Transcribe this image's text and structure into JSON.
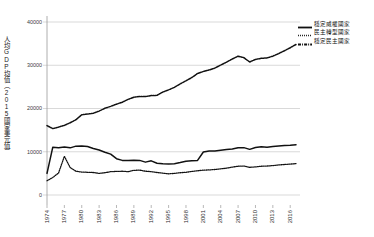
{
  "chart_data": {
    "type": "line",
    "title": "",
    "xlabel": "",
    "ylabel": "人均GDP均值（2015國家美元值）",
    "ylim": [
      0,
      40000
    ],
    "xlim": [
      1974,
      2017
    ],
    "yticks": [
      "0",
      "10000",
      "20000",
      "30000",
      "40000"
    ],
    "ytick_values": [
      0,
      10000,
      20000,
      30000,
      40000
    ],
    "grid": true,
    "legend_position": "top-right",
    "xticks": [
      "1974",
      "1977",
      "1980",
      "1983",
      "1986",
      "1989",
      "1992",
      "1995",
      "1998",
      "2001",
      "2004",
      "2007",
      "2010",
      "2013",
      "2016"
    ],
    "x": [
      1974,
      1975,
      1976,
      1977,
      1978,
      1979,
      1980,
      1981,
      1982,
      1983,
      1984,
      1985,
      1986,
      1987,
      1988,
      1989,
      1990,
      1991,
      1992,
      1993,
      1994,
      1995,
      1996,
      1997,
      1998,
      1999,
      2000,
      2001,
      2002,
      2003,
      2004,
      2005,
      2006,
      2007,
      2008,
      2009,
      2010,
      2011,
      2012,
      2013,
      2014,
      2015,
      2016,
      2017
    ],
    "series": [
      {
        "name": "穩定威權國家",
        "style": "solid",
        "color": "#111111",
        "values": [
          5000,
          11050,
          10950,
          11100,
          10900,
          11300,
          11350,
          11200,
          10750,
          10400,
          9900,
          9450,
          8400,
          8000,
          7950,
          8050,
          8000,
          7600,
          7900,
          7350,
          7200,
          7150,
          7250,
          7500,
          7800,
          7900,
          8000,
          9950,
          10150,
          10200,
          10350,
          10500,
          10650,
          10900,
          10950,
          10550,
          11000,
          11150,
          11050,
          11200,
          11350,
          11450,
          11500,
          11600
        ]
      },
      {
        "name": "民主轉型國家",
        "style": "dotted",
        "color": "#111111",
        "values": [
          3300,
          4050,
          5100,
          8950,
          6350,
          5500,
          5300,
          5250,
          5200,
          5000,
          5150,
          5400,
          5450,
          5500,
          5400,
          5700,
          5750,
          5500,
          5400,
          5200,
          5050,
          4900,
          5000,
          5150,
          5250,
          5450,
          5600,
          5750,
          5800,
          5900,
          6050,
          6200,
          6450,
          6650,
          6700,
          6400,
          6500,
          6650,
          6700,
          6800,
          6950,
          7050,
          7150,
          7250
        ]
      },
      {
        "name": "穩定民主國家",
        "style": "dashdot",
        "color": "#111111",
        "values": [
          16050,
          15350,
          15700,
          16100,
          16700,
          17400,
          18550,
          18700,
          18900,
          19400,
          20050,
          20500,
          21000,
          21450,
          22100,
          22600,
          22800,
          22750,
          23000,
          23050,
          23800,
          24300,
          24900,
          25700,
          26400,
          27150,
          28100,
          28550,
          28900,
          29350,
          30050,
          30700,
          31450,
          32100,
          31750,
          30750,
          31350,
          31600,
          31700,
          32100,
          32700,
          33350,
          34050,
          34800
        ]
      }
    ]
  },
  "legend": {
    "items": [
      {
        "label": "穩定威權國家",
        "style": "solid"
      },
      {
        "label": "民主轉型國家",
        "style": "dotted"
      },
      {
        "label": "穩定民主國家",
        "style": "dashdot"
      }
    ]
  }
}
